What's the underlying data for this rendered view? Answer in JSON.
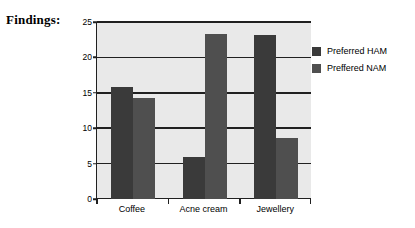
{
  "heading": "Findings:",
  "chart_data": {
    "type": "bar",
    "title": "",
    "xlabel": "",
    "ylabel": "",
    "categories": [
      "Coffee",
      "Acne cream",
      "Jewellery"
    ],
    "series": [
      {
        "name": "Preferred HAM",
        "color": "#3a3a3a",
        "values": [
          15.8,
          5.9,
          23.2
        ]
      },
      {
        "name": "Preffered NAM",
        "color": "#4f4f4f",
        "values": [
          14.3,
          23.3,
          8.6
        ]
      }
    ],
    "ylim": [
      0,
      25
    ],
    "yticks": [
      0,
      5,
      10,
      15,
      20,
      25
    ],
    "grid": true,
    "legend_position": "right",
    "plot_background": "#e9e9e9",
    "axis_color": "#202020"
  }
}
